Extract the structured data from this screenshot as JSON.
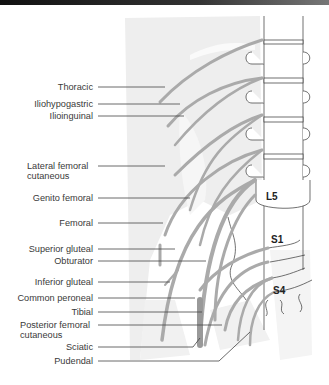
{
  "diagram": {
    "type": "anatomical-illustration",
    "colors": {
      "nerve": "#a9a9a9",
      "shade": "#ececec",
      "outline": "#333333",
      "label_text": "#3a3a3a",
      "leader": "#444444"
    },
    "vertebra_labels": [
      {
        "text": "L5"
      },
      {
        "text": "S1"
      },
      {
        "text": "S4"
      }
    ],
    "nerve_labels": [
      {
        "text": "Thoracic"
      },
      {
        "text": "Iliohypogastric"
      },
      {
        "text": "Ilioinguinal"
      },
      {
        "text": "Lateral femoral",
        "text2": "cutaneous"
      },
      {
        "text": "Genito femoral"
      },
      {
        "text": "Femoral"
      },
      {
        "text": "Superior gluteal"
      },
      {
        "text": "Obturator"
      },
      {
        "text": "Inferior gluteal"
      },
      {
        "text": "Common peroneal"
      },
      {
        "text": "Tibial"
      },
      {
        "text": "Posterior femoral",
        "text2": "cutaneous"
      },
      {
        "text": "Sciatic"
      },
      {
        "text": "Pudendal"
      }
    ]
  }
}
